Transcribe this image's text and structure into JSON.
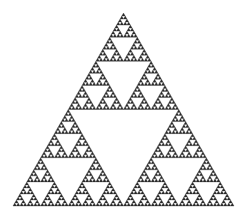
{
  "figure": {
    "background": "#ffffff",
    "fill_color": "#2a2a2a",
    "apex": [
      123.5,
      13
    ],
    "base_left": [
      13,
      206
    ],
    "base_right": [
      234,
      206
    ],
    "depth": 6
  }
}
